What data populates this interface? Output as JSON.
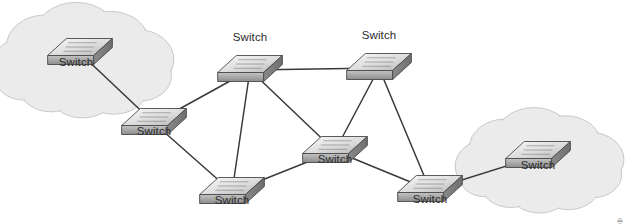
{
  "figure": {
    "type": "network-topology-diagram",
    "title": "",
    "background_color": "#ffffff",
    "credit": "© 2016 Cengage Learning®"
  },
  "styles": {
    "link_color": "#3a3a3a",
    "cloud_fill": "#ebebeb",
    "cloud_stroke": "#c9c9c9",
    "switch_top_light": "#f2f2f2",
    "switch_top_dark": "#b9b9b9",
    "switch_front": "#9a9a9a",
    "switch_side": "#7d7d7d",
    "switch_stroke": "#4a4a4a",
    "label_color": "#2b2b2b"
  },
  "clouds": [
    {
      "id": "cloud-left",
      "name": "left-network-cloud",
      "cx": 84,
      "cy": 62,
      "rx": 78,
      "ry": 46
    },
    {
      "id": "cloud-right",
      "name": "right-network-cloud",
      "cx": 541,
      "cy": 162,
      "rx": 72,
      "ry": 42
    }
  ],
  "nodes": [
    {
      "id": "sw-cloud-left",
      "label": "Switch",
      "icon": "switch-icon",
      "x": 80,
      "y": 47,
      "scale": 1.0,
      "label_position": "below",
      "label_x": 76,
      "label_y": 62
    },
    {
      "id": "sw-left-mid",
      "label": "Switch",
      "icon": "switch-icon",
      "x": 154,
      "y": 117,
      "scale": 1.0,
      "label_position": "below",
      "label_y": 131
    },
    {
      "id": "sw-top-center",
      "label": "Switch",
      "icon": "switch-icon",
      "x": 250,
      "y": 64,
      "scale": 1.0,
      "label_position": "above",
      "label_y": 37
    },
    {
      "id": "sw-top-right",
      "label": "Switch",
      "icon": "switch-icon",
      "x": 379,
      "y": 62,
      "scale": 1.0,
      "label_position": "above",
      "label_y": 35
    },
    {
      "id": "sw-center",
      "label": "Switch",
      "icon": "switch-icon",
      "x": 335,
      "y": 145,
      "scale": 1.0,
      "label_position": "below",
      "label_y": 159
    },
    {
      "id": "sw-bottom-left",
      "label": "Switch",
      "icon": "switch-icon",
      "x": 232,
      "y": 186,
      "scale": 1.0,
      "label_position": "below",
      "label_y": 200
    },
    {
      "id": "sw-bottom-right",
      "label": "Switch",
      "icon": "switch-icon",
      "x": 430,
      "y": 184,
      "scale": 1.0,
      "label_position": "below",
      "label_y": 199
    },
    {
      "id": "sw-cloud-right",
      "label": "Switch",
      "icon": "switch-icon",
      "x": 538,
      "y": 150,
      "scale": 1.0,
      "label_position": "below",
      "label_y": 165
    }
  ],
  "links": [
    {
      "from": "sw-cloud-left",
      "to": "sw-left-mid"
    },
    {
      "from": "sw-left-mid",
      "to": "sw-top-center"
    },
    {
      "from": "sw-left-mid",
      "to": "sw-bottom-left"
    },
    {
      "from": "sw-top-center",
      "to": "sw-top-right"
    },
    {
      "from": "sw-top-center",
      "to": "sw-bottom-left"
    },
    {
      "from": "sw-top-center",
      "to": "sw-center"
    },
    {
      "from": "sw-top-right",
      "to": "sw-center"
    },
    {
      "from": "sw-top-right",
      "to": "sw-bottom-right"
    },
    {
      "from": "sw-center",
      "to": "sw-bottom-left"
    },
    {
      "from": "sw-center",
      "to": "sw-bottom-right"
    },
    {
      "from": "sw-bottom-right",
      "to": "sw-cloud-right"
    }
  ]
}
